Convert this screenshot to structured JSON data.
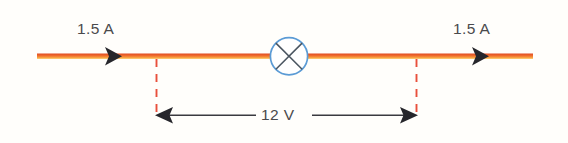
{
  "figure": {
    "background_color": "#fffefb"
  },
  "circuit": {
    "wire": {
      "name": "circuit-wire",
      "color_top": "#ea5a2a",
      "color_bottom": "#f8b44a",
      "start_x": 37,
      "end_x": 533,
      "y": 57
    },
    "component": {
      "name": "lamp-symbol",
      "type": "lamp",
      "circle_color": "#5b9bd5",
      "cross_color": "#4a5560",
      "center_x": 289,
      "center_y": 56,
      "radius": 19
    },
    "current_arrows": [
      {
        "name": "current-arrow-left",
        "direction": "right",
        "x": 105,
        "y": 57,
        "color": "#2b2b30"
      },
      {
        "name": "current-arrow-right",
        "direction": "right",
        "x": 472,
        "y": 57,
        "color": "#2b2b30"
      }
    ],
    "current_labels": [
      {
        "name": "current-label-left",
        "text": "1.5 A",
        "value": "1.5",
        "unit": "A",
        "quantity": "current"
      },
      {
        "name": "current-label-right",
        "text": "1.5 A",
        "value": "1.5",
        "unit": "A",
        "quantity": "current"
      }
    ],
    "measurement": {
      "name": "voltage-measurement",
      "label": "12 V",
      "value": "12",
      "unit": "V",
      "quantity": "potential difference",
      "leader_color": "#e8503c",
      "arrow_color": "#3a3a40",
      "left_x": 156,
      "right_x": 416,
      "line_y": 115,
      "leader_top_y": 60,
      "leader_bottom_y": 115
    }
  },
  "colors": {
    "wire_orange": "#ea5a2a",
    "wire_highlight": "#f8b44a",
    "lamp_blue": "#5b9bd5",
    "dashed_red": "#e8503c",
    "text_gray": "#4a4a4c",
    "arrow_dark": "#2b2b30",
    "background": "#fffefb"
  }
}
